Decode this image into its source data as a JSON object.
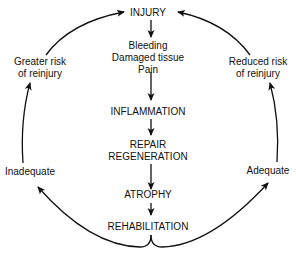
{
  "diagram": {
    "type": "cycle",
    "center_flow": [
      {
        "id": "injury",
        "lines": [
          "INJURY"
        ]
      },
      {
        "id": "symptoms",
        "lines": [
          "Bleeding",
          "Damaged tissue",
          "Pain"
        ]
      },
      {
        "id": "inflammation",
        "lines": [
          "INFLAMMATION"
        ]
      },
      {
        "id": "repair",
        "lines": [
          "REPAIR",
          "REGENERATION"
        ]
      },
      {
        "id": "atrophy",
        "lines": [
          "ATROPHY"
        ]
      },
      {
        "id": "rehabilitation",
        "lines": [
          "REHABILITATION"
        ]
      }
    ],
    "left_branch": {
      "condition": "Inadequate",
      "outcome": [
        "Greater risk",
        "of reinjury"
      ]
    },
    "right_branch": {
      "condition": "Adequate",
      "outcome": [
        "Reduced risk",
        "of reinjury"
      ]
    },
    "stroke_color": "#111111"
  }
}
